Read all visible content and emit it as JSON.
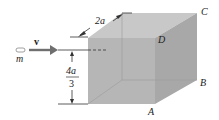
{
  "figure": {
    "type": "physics-diagram",
    "projectile": {
      "mass_label": "m",
      "velocity_label": "v⃗"
    },
    "dimensions": {
      "edge_label": "2a",
      "height_numerator": "4a",
      "height_denominator": "3"
    },
    "vertices": {
      "A": "A",
      "B": "B",
      "C": "C",
      "D": "D"
    },
    "colors": {
      "cube_front": "#b4b4b4",
      "cube_side": "#a6a6a6",
      "cube_top": "#c6c6c6",
      "arrow": "#6f6f6f",
      "line": "#333333"
    }
  }
}
